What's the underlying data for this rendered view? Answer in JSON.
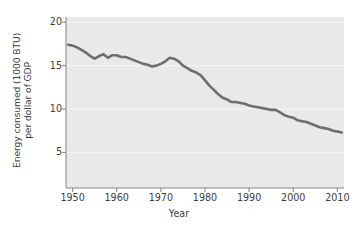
{
  "chart_data": {
    "type": "line",
    "title": "",
    "subtitle": "",
    "xlabel": "Year",
    "ylabel": "Energy consumed (1000 BTU) per dollar of GDP",
    "ylabel_lines": [
      "Energy consumed (1000 BTU)",
      "per dollar of GDP"
    ],
    "xlim": [
      1948.5,
      2011.5
    ],
    "ylim": [
      0.9,
      20.6
    ],
    "xticks": [
      1950,
      1960,
      1970,
      1980,
      1990,
      2000,
      2010
    ],
    "xtick_labels": [
      "1950",
      "1960",
      "1970",
      "1980",
      "1990",
      "2000",
      "2010"
    ],
    "yticks": [
      5,
      10,
      15,
      20
    ],
    "ytick_labels": [
      "5",
      "10",
      "15",
      "20"
    ],
    "grid": "horizontal-white-faint",
    "legend": "none",
    "plot_background": "#e9e9e9",
    "line_color": "#6e6e6e",
    "line_width": 2.6,
    "series": [
      {
        "name": "Energy intensity of US economy",
        "x": [
          1949,
          1950,
          1951,
          1952,
          1953,
          1954,
          1955,
          1956,
          1957,
          1958,
          1959,
          1960,
          1961,
          1962,
          1963,
          1964,
          1965,
          1966,
          1967,
          1968,
          1969,
          1970,
          1971,
          1972,
          1973,
          1974,
          1975,
          1976,
          1977,
          1978,
          1979,
          1980,
          1981,
          1982,
          1983,
          1984,
          1985,
          1986,
          1987,
          1988,
          1989,
          1990,
          1991,
          1992,
          1993,
          1994,
          1995,
          1996,
          1997,
          1998,
          1999,
          2000,
          2001,
          2002,
          2003,
          2004,
          2005,
          2006,
          2007,
          2008,
          2009,
          2010,
          2011
        ],
        "values": [
          17.4,
          17.3,
          17.1,
          16.8,
          16.5,
          16.1,
          15.8,
          16.1,
          16.3,
          15.9,
          16.2,
          16.2,
          16.0,
          16.0,
          15.8,
          15.6,
          15.4,
          15.2,
          15.1,
          14.9,
          15.0,
          15.2,
          15.5,
          15.9,
          15.8,
          15.5,
          15.0,
          14.7,
          14.4,
          14.2,
          13.9,
          13.3,
          12.7,
          12.2,
          11.7,
          11.3,
          11.1,
          10.8,
          10.8,
          10.7,
          10.6,
          10.4,
          10.3,
          10.2,
          10.1,
          10.0,
          9.9,
          9.9,
          9.6,
          9.3,
          9.1,
          9.0,
          8.7,
          8.6,
          8.5,
          8.3,
          8.1,
          7.9,
          7.8,
          7.7,
          7.5,
          7.4,
          7.3
        ]
      }
    ]
  },
  "axes": {
    "xlabel": "Year"
  }
}
